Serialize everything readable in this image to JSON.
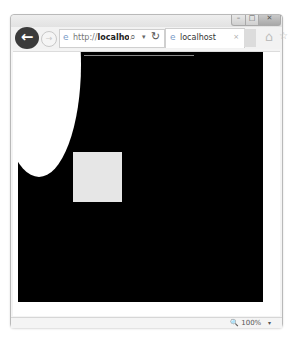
{
  "browser": {
    "window_controls": {
      "minimize_label": "–",
      "maximize_label": "□",
      "close_label": "✕"
    },
    "nav": {
      "back_icon": "←",
      "forward_icon": "→"
    },
    "address_bar": {
      "url_prefix": "http://",
      "url_host": "localhost",
      "url_rest": "/t",
      "search_icon": "⌕",
      "dropdown_icon": "▾",
      "refresh_icon": "↻",
      "site_icon": "e"
    },
    "tabs": [
      {
        "title": "localhost",
        "close_icon": "×",
        "site_icon": "e"
      }
    ],
    "toolbar": {
      "home_icon": "⌂",
      "favorites_icon": "☆"
    },
    "status_bar": {
      "zoom_icon": "🔍",
      "zoom_level": "100%",
      "zoom_dropdown_icon": "▾"
    }
  },
  "page": {
    "canvas": {
      "background": "#000000",
      "shapes": [
        {
          "type": "ellipse",
          "fill": "#ffffff"
        },
        {
          "type": "rect",
          "fill": "#e6e6e6"
        },
        {
          "type": "line",
          "stroke": "#8a8a8a"
        }
      ]
    }
  }
}
